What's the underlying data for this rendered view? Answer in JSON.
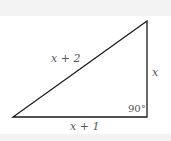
{
  "diagram": {
    "type": "right-triangle",
    "hypotenuse_label": "x + 2",
    "vertical_leg_label": "x",
    "horizontal_leg_label": "x + 1",
    "right_angle_label": "90°",
    "line_color": "#1a1a1a"
  }
}
